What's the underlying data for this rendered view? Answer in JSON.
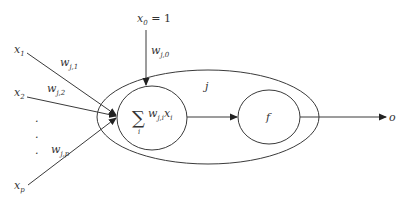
{
  "diagram": {
    "type": "perceptron-neuron",
    "colors": {
      "line": "#3a3a3a",
      "text": "#333333",
      "background": "#ffffff"
    },
    "bias": {
      "input_var": "x",
      "input_sub": "0",
      "value_text": " = 1",
      "weight_var": "w",
      "weight_sub": "j,0"
    },
    "inputs": [
      {
        "var": "x",
        "sub": "1",
        "weight_var": "w",
        "weight_sub": "j,1"
      },
      {
        "var": "x",
        "sub": "2",
        "weight_var": "w",
        "weight_sub": "j,2"
      },
      {
        "var": "x",
        "sub": "p",
        "weight_var": "w",
        "weight_sub": "j,p"
      }
    ],
    "ellipsis": ".",
    "neuron_label": "j",
    "summation": {
      "symbol": "∑",
      "index": "i",
      "term_w": "w",
      "term_w_sub": "j,i",
      "term_x": "x",
      "term_x_sub": "i"
    },
    "activation": {
      "label": "f"
    },
    "output": {
      "label": "o"
    }
  }
}
